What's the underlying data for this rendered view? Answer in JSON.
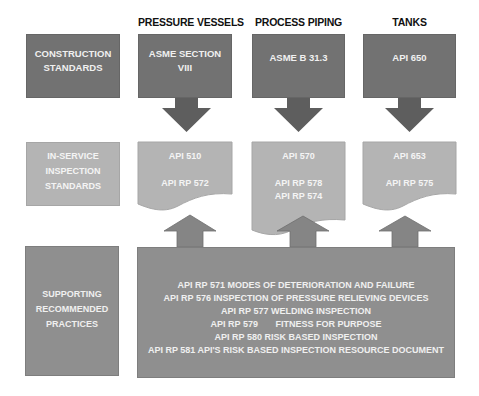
{
  "columns": [
    {
      "header": "PRESSURE VESSELS",
      "construction": "ASME SECTION VIII",
      "inspection": [
        "API 510",
        "",
        "API RP 572"
      ]
    },
    {
      "header": "PROCESS PIPING",
      "construction": "ASME B 31.3",
      "inspection": [
        "API 570",
        "",
        "API RP 578",
        "API RP 574"
      ]
    },
    {
      "header": "TANKS",
      "construction": "API 650",
      "inspection": [
        "API 653",
        "",
        "API RP 575"
      ]
    }
  ],
  "row_labels": {
    "construction": "CONSTRUCTION STANDARDS",
    "inspection": "IN-SERVICE INSPECTION STANDARDS",
    "supporting": "SUPPORTING RECOMMENDED PRACTICES"
  },
  "supporting_practices": [
    "API RP 571 MODES OF DETERIORATION AND FAILURE",
    "API RP 576 INSPECTION OF PRESSURE RELIEVING DEVICES",
    "API RP 577 WELDING INSPECTION",
    "API RP 579       FITNESS FOR PURPOSE",
    "API RP 580 RISK BASED INSPECTION",
    "API RP 581 API'S RISK BASED INSPECTION RESOURCE DOCUMENT"
  ],
  "colors": {
    "dark_box": "#727272",
    "light_box": "#b4b4b4",
    "supporting_box": "#8f8f8f",
    "down_arrow": "#5e5e5e",
    "up_arrow": "#858585"
  }
}
